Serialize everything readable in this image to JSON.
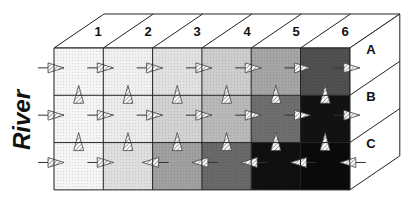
{
  "diagram": {
    "side_label": "River",
    "columns": [
      "1",
      "2",
      "3",
      "4",
      "5",
      "6"
    ],
    "rows": [
      "A",
      "B",
      "C"
    ],
    "cell_gray": [
      [
        245,
        240,
        225,
        205,
        165,
        80
      ],
      [
        245,
        235,
        210,
        185,
        110,
        18
      ],
      [
        245,
        222,
        160,
        105,
        16,
        10
      ]
    ],
    "horizontal_arrows": [
      {
        "row": 0,
        "dirs": [
          "right",
          "right",
          "right",
          "right",
          "right",
          "right",
          "right"
        ]
      },
      {
        "row": 1,
        "dirs": [
          "right",
          "right",
          "right",
          "right",
          "right",
          "right",
          "right"
        ]
      },
      {
        "row": 2,
        "dirs": [
          "right",
          "right",
          "left",
          "left",
          "left",
          "left",
          "left"
        ]
      }
    ],
    "vertical_arrows": [
      {
        "boundary": 1,
        "dirs": [
          "up",
          "up",
          "up",
          "up",
          "up",
          "up"
        ]
      },
      {
        "boundary": 2,
        "dirs": [
          "up",
          "up",
          "up",
          "up",
          "up",
          "up"
        ]
      }
    ],
    "colors": {
      "outline": "#222222",
      "face": "#ffffff"
    }
  }
}
